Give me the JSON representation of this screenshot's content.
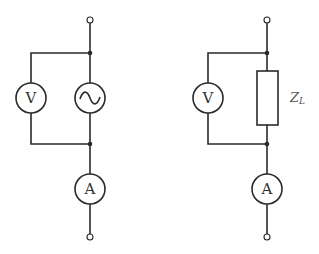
{
  "diagram": {
    "type": "circuit-schematic",
    "circuits": [
      {
        "id": "left",
        "description": "AC source with voltmeter in parallel and ammeter in series",
        "voltmeter": {
          "label": "V"
        },
        "source": {
          "symbol": "ac-source",
          "glyph": "~"
        },
        "ammeter": {
          "label": "A"
        }
      },
      {
        "id": "right",
        "description": "Load impedance with voltmeter in parallel and ammeter in series",
        "voltmeter": {
          "label": "V"
        },
        "load": {
          "symbol": "impedance-box",
          "label": "Z",
          "subscript": "L"
        },
        "ammeter": {
          "label": "A"
        }
      }
    ],
    "colors": {
      "line": "#2a2a2a",
      "text": "#333333",
      "background": "#ffffff"
    }
  }
}
